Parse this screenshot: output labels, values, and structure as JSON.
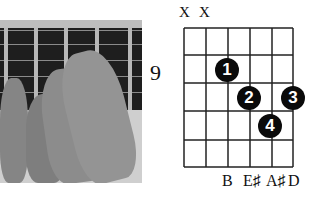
{
  "chord_diagram": {
    "start_fret": "9",
    "muted_strings": [
      "X",
      "X"
    ],
    "fingers": [
      {
        "label": "1",
        "string": 3,
        "fret": 1
      },
      {
        "label": "2",
        "string": 4,
        "fret": 2
      },
      {
        "label": "3",
        "string": 6,
        "fret": 2
      },
      {
        "label": "4",
        "string": 5,
        "fret": 3
      }
    ],
    "note_names": [
      "B",
      "E♯",
      "A♯",
      "D"
    ],
    "strings": 6,
    "frets": 5
  },
  "photo": {
    "description": "hand-fretting-chord-photo"
  }
}
